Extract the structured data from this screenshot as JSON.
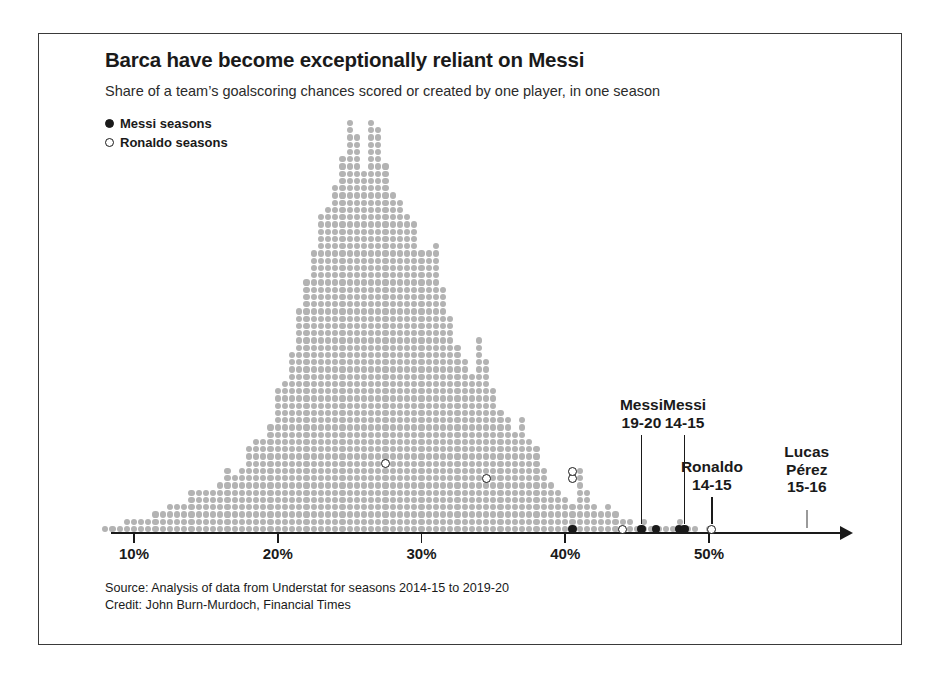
{
  "figure": {
    "title": "Barca have become exceptionally reliant on Messi",
    "subtitle": "Share of a team’s goalscoring chances scored or created by one player, in one season",
    "source_line_1": "Source: Analysis of data from Understat for seasons 2014-15 to 2019-20",
    "source_line_2": "Credit: John Burn-Murdoch, Financial Times"
  },
  "legend": {
    "items": [
      {
        "label": "Messi seasons",
        "marker": "filled-dot",
        "color": "#1a1a1a"
      },
      {
        "label": "Ronaldo seasons",
        "marker": "open-dot",
        "color": "#1a1a1a"
      }
    ]
  },
  "colors": {
    "dot_gray": "#b3b3b3",
    "highlight": "#1a1a1a",
    "frame": "#3a3a3a",
    "callout_light": "#9a9a9a"
  },
  "axis": {
    "ticks": [
      {
        "value": 10,
        "label": "10%"
      },
      {
        "value": 20,
        "label": "20%"
      },
      {
        "value": 30,
        "label": "30%"
      },
      {
        "value": 40,
        "label": "40%"
      },
      {
        "value": 50,
        "label": "50%"
      }
    ],
    "range": [
      7.5,
      58.5
    ],
    "arrow": true
  },
  "callouts": [
    {
      "name": "messi-19-20",
      "lines": [
        "Messi",
        "19-20"
      ],
      "value": 45.3,
      "stack": 1,
      "marker": "filled"
    },
    {
      "name": "messi-14-15",
      "lines": [
        "Messi",
        "14-15"
      ],
      "value": 48.3,
      "stack": 1,
      "marker": "filled"
    },
    {
      "name": "ronaldo-14-15",
      "lines": [
        "Ronaldo",
        "14-15"
      ],
      "value": 50.2,
      "stack": 1,
      "marker": "open"
    },
    {
      "name": "lucas-perez-15-16",
      "lines": [
        "Lucas",
        "Pérez",
        "15-16"
      ],
      "value": 56.8,
      "stack": 1,
      "marker": "none"
    }
  ],
  "chart_data": {
    "type": "bar",
    "subtype": "dot-histogram",
    "title": "Barca have become exceptionally reliant on Messi",
    "subtitle": "Share of a team’s goalscoring chances scored or created by one player, in one season",
    "xlabel": "Share of a team's goalscoring chances scored or created by one player (%)",
    "ylabel": "Number of player-seasons (one dot = one season)",
    "xlim": [
      7.5,
      58.5
    ],
    "ylim": [
      0,
      57
    ],
    "grid": false,
    "legend_position": "top-left",
    "bin_width": 0.5,
    "bin_centers": [
      8.0,
      8.5,
      9.0,
      9.5,
      10.0,
      10.5,
      11.0,
      11.5,
      12.0,
      12.5,
      13.0,
      13.5,
      14.0,
      14.5,
      15.0,
      15.5,
      16.0,
      16.5,
      17.0,
      17.5,
      18.0,
      18.5,
      19.0,
      19.5,
      20.0,
      20.5,
      21.0,
      21.5,
      22.0,
      22.5,
      23.0,
      23.5,
      24.0,
      24.5,
      25.0,
      25.5,
      26.0,
      26.5,
      27.0,
      27.5,
      28.0,
      28.5,
      29.0,
      29.5,
      30.0,
      30.5,
      31.0,
      31.5,
      32.0,
      32.5,
      33.0,
      33.5,
      34.0,
      34.5,
      35.0,
      35.5,
      36.0,
      36.5,
      37.0,
      37.5,
      38.0,
      38.5,
      39.0,
      39.5,
      40.0,
      40.5,
      41.0,
      41.5,
      42.0,
      42.5,
      43.0,
      43.5,
      44.0,
      44.5,
      45.0,
      45.5,
      46.0,
      46.5,
      47.0,
      47.5,
      48.0,
      48.5,
      49.0,
      49.5,
      50.0,
      50.5,
      51.0
    ],
    "counts": [
      1,
      1,
      1,
      2,
      2,
      2,
      2,
      3,
      3,
      4,
      4,
      4,
      6,
      6,
      6,
      6,
      7,
      9,
      8,
      9,
      12,
      13,
      13,
      15,
      20,
      21,
      25,
      31,
      35,
      39,
      44,
      45,
      48,
      52,
      57,
      55,
      50,
      57,
      56,
      51,
      47,
      46,
      44,
      43,
      39,
      39,
      40,
      34,
      30,
      26,
      24,
      22,
      27,
      24,
      20,
      17,
      16,
      14,
      16,
      13,
      12,
      9,
      7,
      6,
      5,
      4,
      9,
      6,
      4,
      3,
      4,
      3,
      2,
      2,
      1,
      2,
      1,
      1,
      1,
      1,
      2,
      1,
      1,
      0,
      1,
      0,
      0
    ],
    "highlighted_points": [
      {
        "label": "Ronaldo",
        "season": "",
        "value": 27.5,
        "rank": 10,
        "series": "Ronaldo seasons"
      },
      {
        "label": "Ronaldo",
        "season": "",
        "value": 34.5,
        "rank": 8,
        "series": "Ronaldo seasons"
      },
      {
        "label": "Ronaldo",
        "season": "",
        "value": 40.5,
        "rank": 8,
        "series": "Ronaldo seasons"
      },
      {
        "label": "Ronaldo",
        "season": "",
        "value": 40.5,
        "rank": 9,
        "series": "Ronaldo seasons"
      },
      {
        "label": "Messi",
        "season": "",
        "value": 40.5,
        "rank": 1,
        "series": "Messi seasons"
      },
      {
        "label": "Ronaldo",
        "season": "",
        "value": 44.0,
        "rank": 1,
        "series": "Ronaldo seasons"
      },
      {
        "label": "Messi",
        "season": "19-20",
        "value": 45.3,
        "rank": 1,
        "series": "Messi seasons"
      },
      {
        "label": "Messi",
        "season": "",
        "value": 46.3,
        "rank": 1,
        "series": "Messi seasons"
      },
      {
        "label": "Messi",
        "season": "",
        "value": 47.9,
        "rank": 1,
        "series": "Messi seasons"
      },
      {
        "label": "Messi",
        "season": "14-15",
        "value": 48.3,
        "rank": 1,
        "series": "Messi seasons"
      },
      {
        "label": "Ronaldo",
        "season": "14-15",
        "value": 50.2,
        "rank": 1,
        "series": "Ronaldo seasons"
      },
      {
        "label": "Lucas Pérez",
        "season": "15-16",
        "value": 56.8,
        "rank": 1,
        "series": "other"
      }
    ]
  }
}
